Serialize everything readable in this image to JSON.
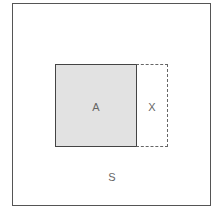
{
  "diagram": {
    "type": "set-region-diagram",
    "outer_region": {
      "label": "S",
      "border": "solid"
    },
    "regions": [
      {
        "label": "A",
        "fill": "#e2e2e2",
        "border": "solid"
      },
      {
        "label": "X",
        "fill": "#ffffff",
        "border": "dashed"
      }
    ]
  }
}
